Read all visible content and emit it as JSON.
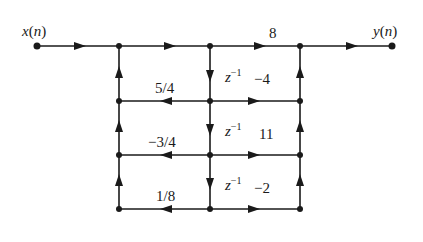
{
  "diagram": {
    "type": "signal-flow-graph",
    "input_label": "x(n)",
    "input_var": "x",
    "input_arg": "n",
    "output_label": "y(n)",
    "output_var": "y",
    "output_arg": "n",
    "delay_label": "z",
    "delay_exp": "−1",
    "feedback_gains": [
      "5/4",
      "−3/4",
      "1/8"
    ],
    "feedforward_gains": [
      "8",
      "−4",
      "11",
      "−2"
    ],
    "colors": {
      "line": "#1a1a1a",
      "background": "#ffffff"
    }
  }
}
